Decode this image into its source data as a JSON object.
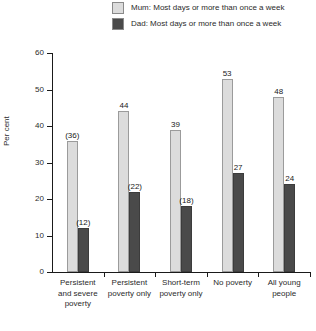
{
  "legend": {
    "items": [
      {
        "label": "Mum: Most days or more than once a week",
        "color": "#dcdcdc",
        "key": "mum"
      },
      {
        "label": "Dad: Most days or more than once a week",
        "color": "#4a4a4a",
        "key": "dad"
      }
    ]
  },
  "axis": {
    "y_title": "Per cent",
    "y_ticks": [
      "0",
      "10",
      "20",
      "30",
      "40",
      "50",
      "60"
    ]
  },
  "chart_data": {
    "type": "bar",
    "title": "",
    "xlabel": "",
    "ylabel": "Per cent",
    "ylim": [
      0,
      60
    ],
    "ytick_step": 10,
    "grid": false,
    "legend_position": "top",
    "categories": [
      "Persistent and severe poverty",
      "Persistent poverty only",
      "Short-term poverty only",
      "No poverty",
      "All young people"
    ],
    "category_lines": [
      [
        "Persistent",
        "and severe",
        "poverty"
      ],
      [
        "Persistent",
        "poverty only"
      ],
      [
        "Short-term",
        "poverty only"
      ],
      [
        "No poverty"
      ],
      [
        "All young",
        "people"
      ]
    ],
    "series": [
      {
        "name": "Mum: Most days or more than once a week",
        "color": "#dcdcdc",
        "values": [
          36,
          44,
          39,
          53,
          48
        ],
        "labels": [
          "(36)",
          "44",
          "39",
          "53",
          "48"
        ]
      },
      {
        "name": "Dad: Most days or more than once a week",
        "color": "#4a4a4a",
        "values": [
          12,
          22,
          18,
          27,
          24
        ],
        "labels": [
          "(12)",
          "(22)",
          "(18)",
          "27",
          "24"
        ]
      }
    ]
  }
}
